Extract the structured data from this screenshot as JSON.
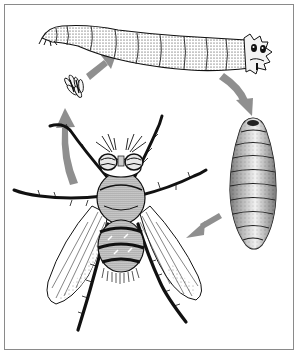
{
  "figure": {
    "type": "life-cycle-illustration",
    "style": "pen-and-ink stipple",
    "stages": [
      {
        "id": "eggs",
        "label": "Eggs"
      },
      {
        "id": "larva",
        "label": "Larva"
      },
      {
        "id": "pupa",
        "label": "Pupa"
      },
      {
        "id": "adult",
        "label": "Adult fly"
      }
    ],
    "arrows": [
      {
        "from": "adult",
        "to": "eggs"
      },
      {
        "from": "eggs",
        "to": "larva"
      },
      {
        "from": "larva",
        "to": "pupa"
      },
      {
        "from": "pupa",
        "to": "adult"
      }
    ]
  },
  "colors": {
    "frame": "#8a8a8a",
    "arrow": "#8f8f8f",
    "ink": "#111111",
    "background": "#ffffff"
  }
}
